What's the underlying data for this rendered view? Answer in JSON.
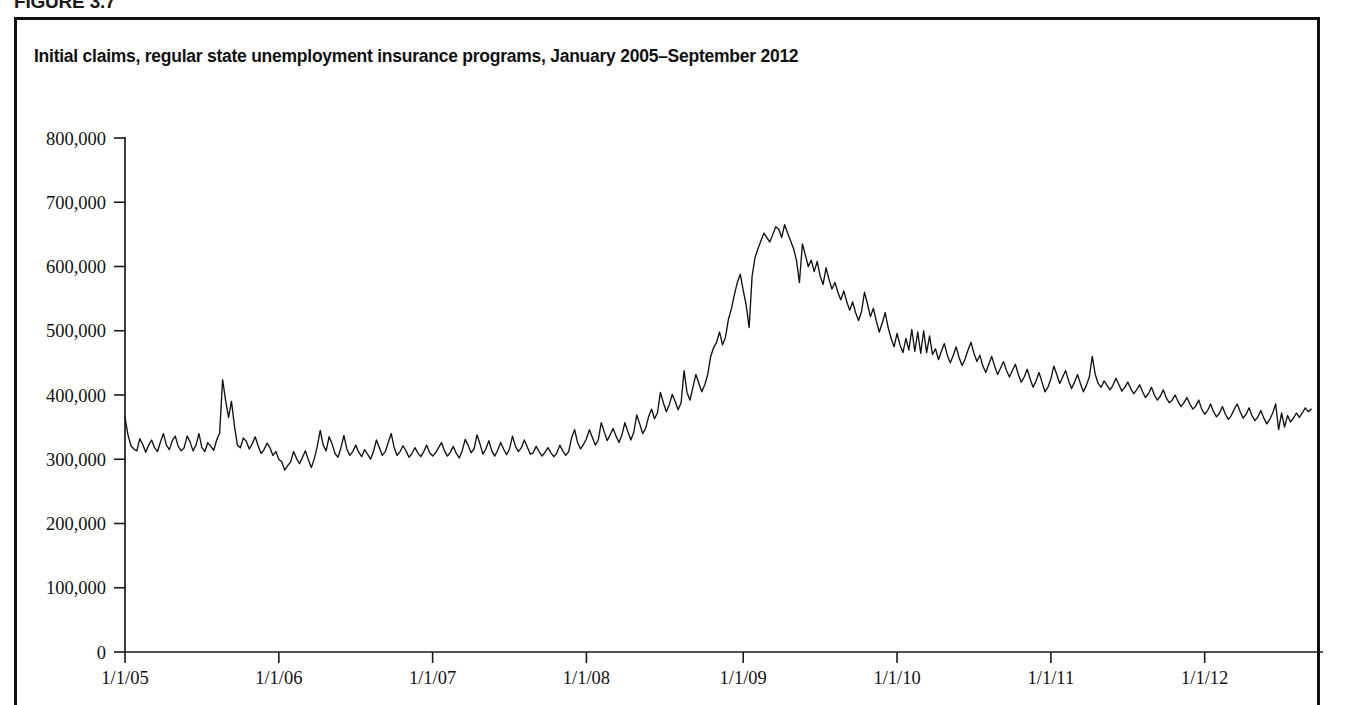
{
  "figure": {
    "label": "FIGURE 3.7",
    "title": "Initial claims, regular state unemployment insurance programs, January 2005–September 2012"
  },
  "colors": {
    "line": "#111111",
    "axis": "#1a1a1a",
    "frame": "#111111",
    "background": "#ffffff"
  },
  "axes": {
    "y_ticks": [
      "0",
      "100,000",
      "200,000",
      "300,000",
      "400,000",
      "500,000",
      "600,000",
      "700,000",
      "800,000"
    ],
    "x_ticks": [
      "1/1/05",
      "1/1/06",
      "1/1/07",
      "1/1/08",
      "1/1/09",
      "1/1/10",
      "1/1/11",
      "1/1/12"
    ]
  },
  "chart_data": {
    "type": "line",
    "title": "Initial claims, regular state unemployment insurance programs, January 2005–September 2012",
    "xlabel": "",
    "ylabel": "",
    "ylim": [
      0,
      800000
    ],
    "ytick_values": [
      0,
      100000,
      200000,
      300000,
      400000,
      500000,
      600000,
      700000,
      800000
    ],
    "xtick_labels": [
      "1/1/05",
      "1/1/06",
      "1/1/07",
      "1/1/08",
      "1/1/09",
      "1/1/10",
      "1/1/11",
      "1/1/12"
    ],
    "xtick_positions": [
      0,
      52,
      104,
      156,
      209,
      261,
      313,
      365
    ],
    "xlim": [
      0,
      405
    ],
    "grid": false,
    "legend": null,
    "frequency": "weekly",
    "series": [
      {
        "name": "Initial claims",
        "units": "claims per week",
        "values": [
          365000,
          338000,
          321000,
          316000,
          313000,
          332000,
          323000,
          311000,
          322000,
          330000,
          318000,
          312000,
          327000,
          340000,
          322000,
          315000,
          329000,
          336000,
          320000,
          313000,
          318000,
          336000,
          327000,
          313000,
          322000,
          340000,
          318000,
          312000,
          326000,
          320000,
          314000,
          330000,
          341000,
          424000,
          392000,
          365000,
          390000,
          352000,
          322000,
          318000,
          333000,
          328000,
          316000,
          324000,
          335000,
          321000,
          309000,
          315000,
          325000,
          318000,
          306000,
          312000,
          300000,
          296000,
          283000,
          290000,
          296000,
          312000,
          301000,
          293000,
          303000,
          313000,
          299000,
          287000,
          301000,
          320000,
          345000,
          322000,
          313000,
          335000,
          324000,
          309000,
          303000,
          318000,
          337000,
          316000,
          306000,
          312000,
          322000,
          311000,
          304000,
          315000,
          308000,
          300000,
          312000,
          330000,
          318000,
          306000,
          312000,
          326000,
          340000,
          318000,
          306000,
          312000,
          321000,
          313000,
          303000,
          309000,
          318000,
          310000,
          304000,
          312000,
          322000,
          310000,
          305000,
          310000,
          318000,
          326000,
          313000,
          305000,
          311000,
          320000,
          309000,
          302000,
          313000,
          331000,
          322000,
          310000,
          316000,
          338000,
          324000,
          308000,
          316000,
          329000,
          313000,
          305000,
          314000,
          326000,
          316000,
          307000,
          316000,
          336000,
          320000,
          312000,
          318000,
          330000,
          319000,
          308000,
          310000,
          320000,
          312000,
          305000,
          311000,
          318000,
          310000,
          304000,
          310000,
          322000,
          313000,
          306000,
          312000,
          334000,
          346000,
          326000,
          316000,
          323000,
          332000,
          346000,
          334000,
          322000,
          330000,
          357000,
          343000,
          329000,
          338000,
          348000,
          336000,
          326000,
          338000,
          357000,
          343000,
          330000,
          342000,
          369000,
          355000,
          340000,
          348000,
          366000,
          378000,
          363000,
          372000,
          404000,
          388000,
          374000,
          385000,
          401000,
          390000,
          377000,
          388000,
          438000,
          404000,
          392000,
          412000,
          432000,
          418000,
          405000,
          416000,
          432000,
          460000,
          474000,
          482000,
          498000,
          478000,
          490000,
          518000,
          534000,
          556000,
          575000,
          588000,
          563000,
          540000,
          505000,
          585000,
          614000,
          628000,
          640000,
          652000,
          645000,
          638000,
          650000,
          662000,
          658000,
          645000,
          665000,
          652000,
          640000,
          628000,
          610000,
          575000,
          635000,
          618000,
          600000,
          610000,
          592000,
          608000,
          585000,
          572000,
          598000,
          580000,
          565000,
          575000,
          560000,
          548000,
          562000,
          545000,
          532000,
          545000,
          528000,
          516000,
          530000,
          560000,
          542000,
          522000,
          535000,
          515000,
          498000,
          512000,
          528000,
          505000,
          488000,
          475000,
          496000,
          478000,
          466000,
          488000,
          470000,
          502000,
          468000,
          498000,
          465000,
          500000,
          466000,
          492000,
          463000,
          472000,
          455000,
          468000,
          480000,
          462000,
          450000,
          462000,
          475000,
          458000,
          446000,
          456000,
          470000,
          482000,
          465000,
          452000,
          462000,
          445000,
          435000,
          448000,
          460000,
          445000,
          432000,
          442000,
          452000,
          438000,
          428000,
          438000,
          448000,
          432000,
          420000,
          428000,
          440000,
          425000,
          412000,
          422000,
          435000,
          420000,
          405000,
          412000,
          425000,
          445000,
          432000,
          418000,
          428000,
          438000,
          422000,
          410000,
          420000,
          432000,
          418000,
          405000,
          415000,
          428000,
          460000,
          432000,
          418000,
          412000,
          422000,
          415000,
          408000,
          415000,
          426000,
          416000,
          406000,
          412000,
          420000,
          410000,
          402000,
          408000,
          416000,
          405000,
          396000,
          402000,
          412000,
          400000,
          392000,
          398000,
          408000,
          396000,
          388000,
          392000,
          400000,
          390000,
          382000,
          388000,
          396000,
          386000,
          378000,
          383000,
          392000,
          378000,
          370000,
          376000,
          386000,
          374000,
          366000,
          372000,
          382000,
          370000,
          362000,
          368000,
          378000,
          386000,
          374000,
          364000,
          370000,
          380000,
          368000,
          360000,
          366000,
          376000,
          364000,
          355000,
          362000,
          372000,
          386000,
          346000,
          372000,
          350000,
          368000,
          358000,
          364000,
          372000,
          365000,
          372000,
          380000,
          374000,
          378000
        ]
      }
    ],
    "annotations": [
      {
        "label": "Hurricane Katrina spike",
        "approx_date": "9/2005",
        "value": 424000
      },
      {
        "label": "Great Recession peak",
        "approx_date": "3/2009",
        "value": 665000
      },
      {
        "label": "Series start",
        "approx_date": "1/1/2005",
        "value": 365000
      },
      {
        "label": "Series end",
        "approx_date": "9/2012",
        "value": 378000
      }
    ]
  }
}
